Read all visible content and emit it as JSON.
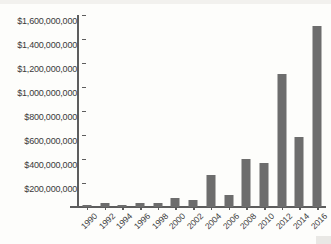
{
  "chart_data": {
    "type": "bar",
    "title": "",
    "xlabel": "",
    "ylabel": "",
    "categories": [
      "1990",
      "1992",
      "1994",
      "1996",
      "1998",
      "2000",
      "2002",
      "2004",
      "2006",
      "2008",
      "2010",
      "2012",
      "2014",
      "2016"
    ],
    "values": [
      15000000,
      35000000,
      15000000,
      35000000,
      30000000,
      75000000,
      60000000,
      270000000,
      100000000,
      400000000,
      365000000,
      1110000000,
      585000000,
      1510000000
    ],
    "ylim": [
      0,
      1600000000
    ],
    "ytick_values": [
      200000000,
      400000000,
      600000000,
      800000000,
      1000000000,
      1200000000,
      1400000000,
      1600000000
    ],
    "ytick_labels": [
      "$200,000,000",
      "$400,000,000",
      "$600,000,000",
      "$800,000,000",
      "$1,000,000,000",
      "$1,200,000,000",
      "$1,400,000,000",
      "$1,600,000,000"
    ],
    "grid": false,
    "legend": false,
    "bar_color": "#6d6d6d",
    "axis_color": "#5d5d5d",
    "background_color": "#fdfdfb",
    "xtick_rotation": -45
  }
}
